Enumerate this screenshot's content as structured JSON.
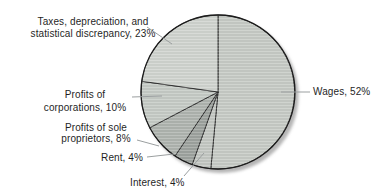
{
  "chart_data": {
    "type": "pie",
    "title": "",
    "unit": "%",
    "direction": "clockwise",
    "start_angle_deg": 0,
    "legend_position": "none",
    "label_style": "outside-with-leader-lines",
    "slices": [
      {
        "label": "Wages",
        "value": 52,
        "color": "#c6cac5"
      },
      {
        "label": "Interest",
        "value": 4,
        "color": "#c3c7c2"
      },
      {
        "label": "Rent",
        "value": 4,
        "color": "#9da29e"
      },
      {
        "label": "Profits of sole proprietors",
        "value": 8,
        "color": "#aeb3ae"
      },
      {
        "label": "Profits of corporations",
        "value": 10,
        "color": "#c5cac5"
      },
      {
        "label": "Taxes, depreciation, and statistical discrepancy",
        "value": 23,
        "color": "#cfd3ce"
      }
    ]
  },
  "labels": {
    "taxes": {
      "line1": "Taxes, depreciation, and",
      "line2": "statistical discrepancy, 23%"
    },
    "corporations": {
      "line1": "Profits of",
      "line2": "corporations, 10%"
    },
    "sole_proprietors": {
      "line1": "Profits of sole",
      "line2": "proprietors, 8%"
    },
    "rent": {
      "text": "Rent, 4%"
    },
    "interest": {
      "text": "Interest, 4%"
    },
    "wages": {
      "text": "Wages, 52%"
    }
  },
  "colors": {
    "slice_border": "#2a2a2a",
    "outer_rim": "#1c1c1c",
    "leader_line": "#9b9fa0",
    "shadow": "#b5b5b5",
    "text": "#1f1f1f",
    "background": "#ffffff"
  }
}
